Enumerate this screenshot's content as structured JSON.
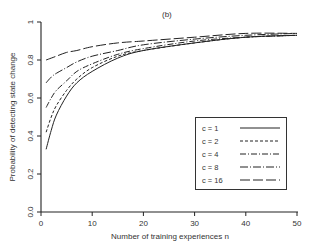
{
  "chart_data": {
    "type": "line",
    "title": "(b)",
    "xlabel": "Number of training experiences n",
    "ylabel": "Probability of detecting state change",
    "xlim": [
      0,
      50
    ],
    "ylim": [
      0,
      1
    ],
    "xticks": [
      0,
      10,
      20,
      30,
      40,
      50
    ],
    "yticks": [
      0.0,
      0.2,
      0.4,
      0.6,
      0.8,
      1.0
    ],
    "ytick_labels": [
      "0.0",
      "0.2",
      "0.4",
      "0.6",
      "0.8",
      "1"
    ],
    "grid": false,
    "legend_position": "lower right (inside plot)",
    "x": [
      1,
      2,
      3,
      5,
      7,
      10,
      15,
      20,
      30,
      40,
      50
    ],
    "series": [
      {
        "name": "c = 1",
        "style": "solid",
        "values": [
          0.33,
          0.43,
          0.51,
          0.61,
          0.68,
          0.74,
          0.81,
          0.85,
          0.89,
          0.92,
          0.93
        ]
      },
      {
        "name": "c = 2",
        "style": "short-dash",
        "values": [
          0.42,
          0.5,
          0.56,
          0.64,
          0.7,
          0.76,
          0.82,
          0.85,
          0.89,
          0.92,
          0.93
        ]
      },
      {
        "name": "c = 4",
        "style": "dash-dot",
        "values": [
          0.55,
          0.6,
          0.64,
          0.69,
          0.74,
          0.78,
          0.83,
          0.86,
          0.9,
          0.92,
          0.93
        ]
      },
      {
        "name": "c = 8",
        "style": "long-dash-dot",
        "values": [
          0.68,
          0.71,
          0.73,
          0.76,
          0.79,
          0.82,
          0.85,
          0.88,
          0.91,
          0.93,
          0.94
        ]
      },
      {
        "name": "c = 16",
        "style": "long-dash",
        "values": [
          0.8,
          0.81,
          0.82,
          0.84,
          0.85,
          0.87,
          0.89,
          0.9,
          0.92,
          0.94,
          0.94
        ]
      }
    ]
  },
  "legend": {
    "items": [
      {
        "label": "c = 1"
      },
      {
        "label": "c = 2"
      },
      {
        "label": "c = 4"
      },
      {
        "label": "c = 8"
      },
      {
        "label": "c = 16"
      }
    ]
  }
}
